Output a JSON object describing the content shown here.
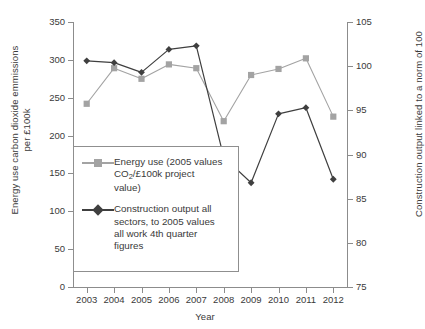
{
  "chart_data": {
    "type": "line",
    "title": "",
    "xlabel": "Year",
    "ylabel": "Energy use carbon dioxide emmissions per £100k",
    "ylabel_secondary": "Construction output linked to a norm of 100",
    "categories": [
      "2003",
      "2004",
      "2005",
      "2006",
      "2007",
      "2008",
      "2009",
      "2010",
      "2011",
      "2012"
    ],
    "x": [
      2003,
      2004,
      2005,
      2006,
      2007,
      2008,
      2009,
      2010,
      2011,
      2012
    ],
    "ylim": [
      0,
      350
    ],
    "ylim_secondary": [
      75,
      105
    ],
    "yticks": [
      0,
      50,
      100,
      150,
      200,
      250,
      300,
      350
    ],
    "yticks_secondary": [
      75,
      80,
      85,
      90,
      95,
      100,
      105
    ],
    "grid": false,
    "legend_position": "inner-lower-left",
    "series": [
      {
        "name": "Energy use (2005 values CO2/£100k project value)",
        "axis": "left",
        "marker": "square",
        "color": "#a3a3a3",
        "values": [
          242,
          289,
          275,
          294,
          289,
          219,
          280,
          288,
          302,
          225
        ]
      },
      {
        "name": "Construction output all sectors, to 2005 values all work 4th quarter figures",
        "axis": "right",
        "marker": "diamond",
        "color": "#3f3f3f",
        "values": [
          100.6,
          100.4,
          99.3,
          101.9,
          102.3,
          89.7,
          86.8,
          94.6,
          95.3,
          87.2
        ]
      }
    ]
  },
  "axes": {
    "x_title": "Year",
    "y_left_title_line1": "Energy use carbon dioxide emmissions",
    "y_left_title_line2": "per £100k",
    "y_right_title": "Construction output linked to a norm of 100",
    "y_left_ticks": [
      "350",
      "300",
      "250",
      "200",
      "150",
      "100",
      "50",
      "0"
    ],
    "y_right_ticks": [
      "105",
      "100",
      "95",
      "90",
      "85",
      "80",
      "75"
    ],
    "x_ticks": [
      "2003",
      "2004",
      "2005",
      "2006",
      "2007",
      "2008",
      "2009",
      "2010",
      "2011",
      "2012"
    ]
  },
  "legend": {
    "entries": [
      {
        "key": "energy-use",
        "marker": "square-marker",
        "color": "#a3a3a3",
        "line1": "Energy use (2005 values",
        "line2_pre": "CO",
        "line2_sub": "2",
        "line2_post": "/£100k project",
        "line3": "value)"
      },
      {
        "key": "construction-output",
        "marker": "diamond-marker",
        "color": "#3f3f3f",
        "line1": "Construction output all",
        "line2": "sectors, to 2005 values",
        "line3": "all work 4th quarter",
        "line4": "figures"
      }
    ]
  },
  "colors": {
    "energy_series": "#a3a3a3",
    "construction_series": "#3f3f3f",
    "axis": "#8c8c8c",
    "text": "#3a3a3a",
    "background": "#ffffff"
  }
}
